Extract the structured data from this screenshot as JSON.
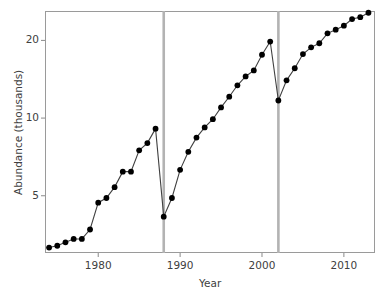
{
  "chart_data": {
    "type": "line",
    "title": "",
    "xlabel": "Year",
    "ylabel": "Abundance (thousands)",
    "yscale": "log",
    "xlim": [
      1973.5,
      2013.8
    ],
    "ylim": [
      3.0,
      26.0
    ],
    "grid": false,
    "legend": null,
    "yticks": [
      5,
      10,
      20
    ],
    "ytick_labels": [
      "5",
      "10",
      "20"
    ],
    "xticks": [
      1980,
      1990,
      2000,
      2010
    ],
    "xtick_labels": [
      "1980",
      "1990",
      "2000",
      "2010"
    ],
    "marker": "filled-circle",
    "marker_color": "#000000",
    "line_color": "#404040",
    "annotations": [
      {
        "type": "vline",
        "x": 1988,
        "color": "#b3b3b3",
        "label": "vertical-reference-line-1988"
      },
      {
        "type": "vline",
        "x": 2002,
        "color": "#b3b3b3",
        "label": "vertical-reference-line-2002"
      }
    ],
    "x": [
      1974,
      1975,
      1976,
      1977,
      1978,
      1979,
      1980,
      1981,
      1982,
      1983,
      1984,
      1985,
      1986,
      1987,
      1988,
      1989,
      1990,
      1991,
      1992,
      1993,
      1994,
      1995,
      1996,
      1997,
      1998,
      1999,
      2000,
      2001,
      2002,
      2003,
      2004,
      2005,
      2006,
      2007,
      2008,
      2009,
      2010,
      2011,
      2012,
      2013
    ],
    "values": [
      3.15,
      3.2,
      3.3,
      3.4,
      3.4,
      3.7,
      4.7,
      4.9,
      5.4,
      6.2,
      6.2,
      7.5,
      8.0,
      9.1,
      4.15,
      4.9,
      6.3,
      7.4,
      8.4,
      9.2,
      9.9,
      11.0,
      12.1,
      13.4,
      14.5,
      15.3,
      17.6,
      19.8,
      11.7,
      14.0,
      15.6,
      17.7,
      18.8,
      19.5,
      21.3,
      22.0,
      22.8,
      24.2,
      24.6,
      25.6
    ],
    "series": [
      {
        "name": "Abundance",
        "x": [
          1974,
          1975,
          1976,
          1977,
          1978,
          1979,
          1980,
          1981,
          1982,
          1983,
          1984,
          1985,
          1986,
          1987,
          1988,
          1989,
          1990,
          1991,
          1992,
          1993,
          1994,
          1995,
          1996,
          1997,
          1998,
          1999,
          2000,
          2001,
          2002,
          2003,
          2004,
          2005,
          2006,
          2007,
          2008,
          2009,
          2010,
          2011,
          2012,
          2013
        ],
        "values": [
          3.15,
          3.2,
          3.3,
          3.4,
          3.4,
          3.7,
          4.7,
          4.9,
          5.4,
          6.2,
          6.2,
          7.5,
          8.0,
          9.1,
          4.15,
          4.9,
          6.3,
          7.4,
          8.4,
          9.2,
          9.9,
          11.0,
          12.1,
          13.4,
          14.5,
          15.3,
          17.6,
          19.8,
          11.7,
          14.0,
          15.6,
          17.7,
          18.8,
          19.5,
          21.3,
          22.0,
          22.8,
          24.2,
          24.6,
          25.6
        ]
      }
    ]
  }
}
